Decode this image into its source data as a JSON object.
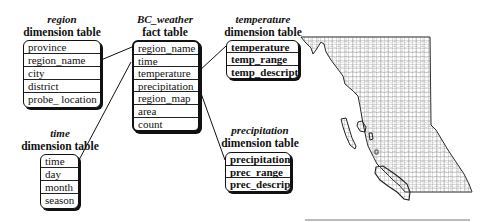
{
  "diagram": {
    "region": {
      "name": "region",
      "type": "dimension table",
      "attributes": [
        "province",
        "region_name",
        "city",
        "district",
        "probe_ location"
      ]
    },
    "fact": {
      "name": "BC_weather",
      "type": "fact table",
      "attributes": [
        "region_name",
        "time",
        "temperature",
        "precipitation",
        "region_map",
        "area",
        "count"
      ]
    },
    "temperature": {
      "name": "temperature",
      "type": "dimension table",
      "attributes": [
        "temperature",
        "temp_range",
        "temp_descript"
      ]
    },
    "precipitation": {
      "name": "precipitation",
      "type": "dimension table",
      "attributes": [
        "precipitation",
        "prec_range",
        "prec_descript"
      ]
    },
    "time": {
      "name": "time",
      "type": "dimension table",
      "attributes": [
        "time",
        "day",
        "month",
        "season"
      ]
    },
    "map": {
      "label": "british-columbia-region-map"
    }
  }
}
